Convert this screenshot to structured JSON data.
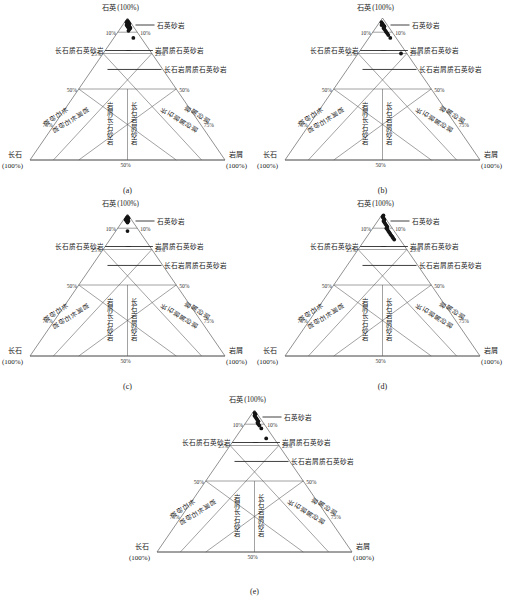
{
  "figure": {
    "type": "ternary-classification-diagrams",
    "panel_count": 5,
    "caption_labels": [
      "(a)",
      "(b)",
      "(c)",
      "(d)",
      "(e)"
    ]
  },
  "axes": {
    "apex_label": "石英",
    "apex_value": "(100%)",
    "left_corner_label": "长石",
    "left_corner_value": "(100%)",
    "right_corner_label": "岩屑",
    "right_corner_value": "(100%)",
    "bottom_mid_tick": "50%",
    "left_ticks": [
      "10%",
      "25%",
      "50%",
      "75%"
    ],
    "right_ticks": [
      "10%",
      "25%",
      "50%",
      "75%"
    ]
  },
  "field_labels": {
    "quartz_arenite": "石英砂岩",
    "feldspathic_quartz_arenite": "长石质石英砂岩",
    "lithic_quartz_arenite": "岩屑质石英砂岩",
    "feldspathic_lithic_quartz_arenite": "长石岩屑质石英砂岩",
    "arkose": "长石砂岩",
    "lithic_arkose": "岩屑长石砂岩",
    "feldspathic_litharenite": "长石岩屑砂岩",
    "litharenite": "岩屑砂岩"
  },
  "colors": {
    "ink": "#1a1a1a",
    "line": "#555555",
    "base_line": "#7a7a7a",
    "point": "#141414",
    "background": "#ffffff"
  },
  "chart_data": {
    "type": "scatter",
    "title": "",
    "xlabel": "",
    "ylabel": "",
    "grid": false,
    "legend": "none",
    "ternary_vertices": [
      "石英 (100%)",
      "长石 (100%)",
      "岩屑 (100%)"
    ],
    "panels": [
      {
        "label": "(a)",
        "n_points": 14,
        "cluster_description": "dense blob just below quartz apex, one outlier near 10%-25% zone",
        "points_qfr": [
          [
            98,
            1,
            1
          ],
          [
            97,
            2,
            1
          ],
          [
            97,
            1,
            2
          ],
          [
            96,
            2,
            2
          ],
          [
            96,
            1,
            3
          ],
          [
            95,
            2,
            3
          ],
          [
            95,
            3,
            2
          ],
          [
            94,
            2,
            4
          ],
          [
            94,
            3,
            3
          ],
          [
            93,
            3,
            4
          ],
          [
            93,
            2,
            5
          ],
          [
            92,
            3,
            5
          ],
          [
            91,
            4,
            5
          ],
          [
            86,
            4,
            10
          ]
        ]
      },
      {
        "label": "(b)",
        "n_points": 13,
        "cluster_description": "points strung down-right from apex, one isolated point on the 25% lithic line",
        "points_qfr": [
          [
            97,
            2,
            1
          ],
          [
            96,
            2,
            2
          ],
          [
            95,
            2,
            3
          ],
          [
            95,
            3,
            2
          ],
          [
            94,
            2,
            4
          ],
          [
            93,
            3,
            4
          ],
          [
            92,
            3,
            5
          ],
          [
            91,
            3,
            6
          ],
          [
            90,
            3,
            7
          ],
          [
            89,
            3,
            8
          ],
          [
            88,
            3,
            9
          ],
          [
            86,
            3,
            11
          ],
          [
            75,
            3,
            22
          ]
        ]
      },
      {
        "label": "(c)",
        "n_points": 9,
        "cluster_description": "compact triangular blob at apex plus one point below near 10% line",
        "points_qfr": [
          [
            98,
            1,
            1
          ],
          [
            97,
            2,
            1
          ],
          [
            97,
            1,
            2
          ],
          [
            96,
            2,
            2
          ],
          [
            96,
            3,
            1
          ],
          [
            95,
            2,
            3
          ],
          [
            95,
            3,
            2
          ],
          [
            94,
            3,
            3
          ],
          [
            88,
            6,
            6
          ]
        ]
      },
      {
        "label": "(d)",
        "n_points": 18,
        "cluster_description": "thick elongated streak running from apex down toward 25% line",
        "points_qfr": [
          [
            99,
            0,
            1
          ],
          [
            98,
            1,
            1
          ],
          [
            97,
            1,
            2
          ],
          [
            96,
            1,
            3
          ],
          [
            95,
            2,
            3
          ],
          [
            94,
            2,
            4
          ],
          [
            93,
            2,
            5
          ],
          [
            92,
            2,
            6
          ],
          [
            91,
            2,
            7
          ],
          [
            90,
            3,
            7
          ],
          [
            89,
            3,
            8
          ],
          [
            88,
            3,
            9
          ],
          [
            87,
            3,
            10
          ],
          [
            86,
            3,
            11
          ],
          [
            85,
            3,
            12
          ],
          [
            84,
            3,
            13
          ],
          [
            83,
            3,
            14
          ],
          [
            82,
            3,
            15
          ]
        ]
      },
      {
        "label": "(e)",
        "n_points": 12,
        "cluster_description": "tapering streak from apex toward lithic side, one point near 25% line",
        "points_qfr": [
          [
            98,
            1,
            1
          ],
          [
            97,
            1,
            2
          ],
          [
            96,
            2,
            2
          ],
          [
            95,
            2,
            3
          ],
          [
            94,
            2,
            4
          ],
          [
            93,
            2,
            5
          ],
          [
            92,
            2,
            6
          ],
          [
            91,
            3,
            6
          ],
          [
            90,
            3,
            7
          ],
          [
            89,
            3,
            8
          ],
          [
            87,
            3,
            10
          ],
          [
            80,
            4,
            16
          ]
        ]
      }
    ]
  }
}
